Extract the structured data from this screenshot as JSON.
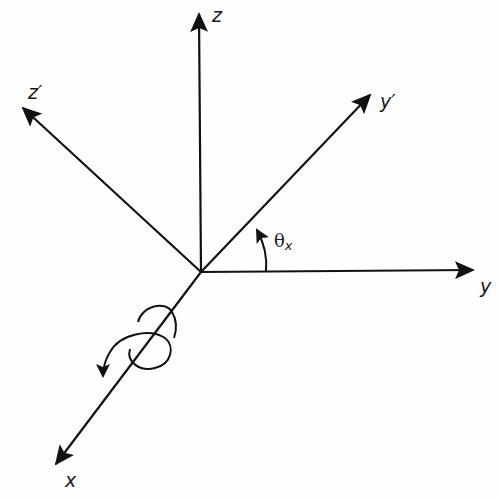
{
  "diagram": {
    "stroke_color": "#111111",
    "background_color": "#ffffff",
    "origin": {
      "x": 201,
      "y": 272
    },
    "axes": [
      {
        "id": "z",
        "label": "z",
        "tip": {
          "x": 199,
          "y": 13
        }
      },
      {
        "id": "z_prime",
        "label": "z′",
        "tip": {
          "x": 22,
          "y": 107
        }
      },
      {
        "id": "y_prime",
        "label": "y′",
        "tip": {
          "x": 371,
          "y": 94
        }
      },
      {
        "id": "y",
        "label": "y",
        "tip": {
          "x": 474,
          "y": 270
        }
      },
      {
        "id": "x",
        "label": "x",
        "tip": {
          "x": 55,
          "y": 465
        }
      }
    ],
    "angle": {
      "symbol": "θ",
      "subscript": "x",
      "description": "angle from y to y′"
    },
    "rotation_indicator": {
      "description": "curved arrow around the x-axis indicating rotation"
    }
  },
  "labels": {
    "z": "z",
    "z_prime": "z′",
    "y_prime": "y′",
    "y": "y",
    "x": "x",
    "theta": "θ",
    "theta_sub": "x"
  }
}
